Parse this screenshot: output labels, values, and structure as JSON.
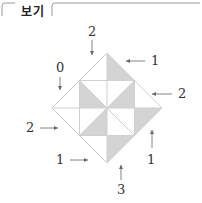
{
  "header": {
    "label": "보기"
  },
  "diagram": {
    "shade_color": "#d4d4d4",
    "line_color": "#cfcfcf",
    "labels": [
      {
        "id": "top",
        "text": "2"
      },
      {
        "id": "top-right",
        "text": "1"
      },
      {
        "id": "upper-left",
        "text": "0"
      },
      {
        "id": "right",
        "text": "2"
      },
      {
        "id": "left",
        "text": "2"
      },
      {
        "id": "lower-left",
        "text": "1"
      },
      {
        "id": "lower-right",
        "text": "1"
      },
      {
        "id": "bottom",
        "text": "3"
      }
    ]
  }
}
